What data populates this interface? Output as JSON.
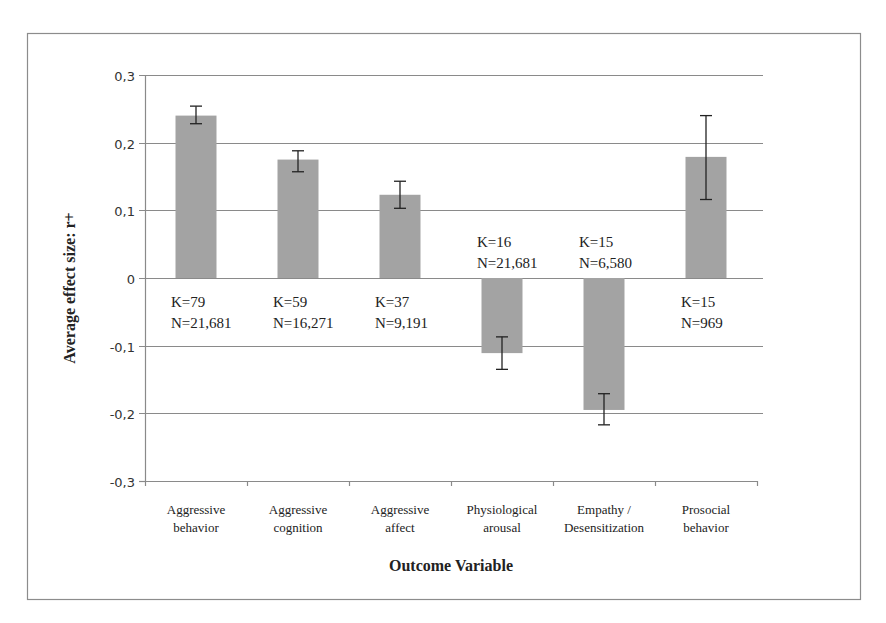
{
  "chart_data": {
    "type": "bar",
    "title": "",
    "xlabel": "Outcome Variable",
    "ylabel": "Average effect size: r+",
    "ylim": [
      -0.3,
      0.3
    ],
    "yticks": [
      0.3,
      0.2,
      0.1,
      0,
      -0.1,
      -0.2,
      -0.3
    ],
    "ytick_labels": [
      "0,3",
      "0,2",
      "0,1",
      "0",
      "-0,1",
      "-0,2",
      "-0,3"
    ],
    "grid": true,
    "legend": null,
    "categories": [
      [
        "Aggressive",
        "behavior"
      ],
      [
        "Aggressive",
        "cognition"
      ],
      [
        "Aggressive",
        "affect"
      ],
      [
        "Physiological",
        "arousal"
      ],
      [
        "Empathy /",
        "Desensitization"
      ],
      [
        "Prosocial",
        "behavior"
      ]
    ],
    "values": [
      0.24,
      0.175,
      0.123,
      -0.111,
      -0.195,
      0.179
    ],
    "error_low": [
      0.228,
      0.157,
      0.103,
      -0.135,
      -0.217,
      0.116
    ],
    "error_high": [
      0.254,
      0.188,
      0.143,
      -0.087,
      -0.171,
      0.24
    ],
    "annotations": [
      {
        "k": "K=79",
        "n": "N=21,681",
        "position": "below"
      },
      {
        "k": "K=59",
        "n": "N=16,271",
        "position": "below"
      },
      {
        "k": "K=37",
        "n": "N=9,191",
        "position": "below"
      },
      {
        "k": "K=16",
        "n": "N=21,681",
        "position": "above"
      },
      {
        "k": "K=15",
        "n": "N=6,580",
        "position": "above"
      },
      {
        "k": "K=15",
        "n": "N=969",
        "position": "below"
      }
    ],
    "colors": {
      "bar": "#a3a3a3",
      "grid": "#8a8a8a",
      "axis": "#8a8a8a",
      "frame": "#8c8c8c",
      "error_bar": "#222222"
    }
  }
}
